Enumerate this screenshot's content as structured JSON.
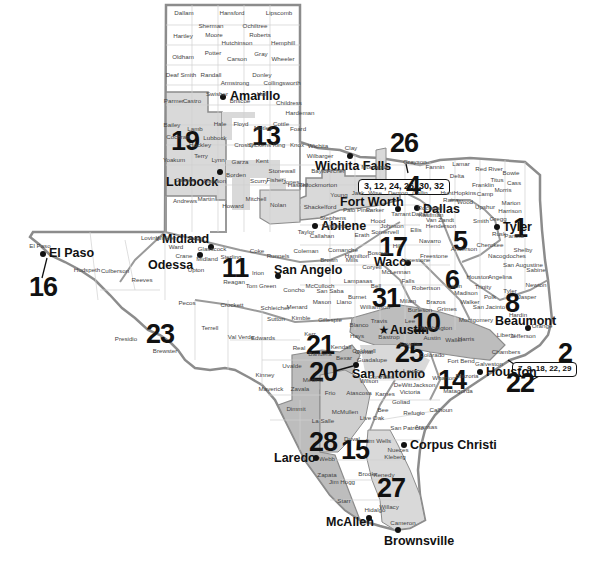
{
  "map": {
    "title": "Texas Regions Map",
    "colors": {
      "shaded_region": "#d9d9d9",
      "dark_shaded_region": "#bdbdbd",
      "border": "#8c8c8c",
      "county_line": "#cfcfcf",
      "text": "#111111"
    },
    "callouts": [
      {
        "id": "north",
        "text": "3, 12, 24, 26, 30, 32"
      },
      {
        "id": "gulf",
        "text": "7, 9, 18, 22, 29"
      }
    ],
    "regions": [
      {
        "number": "1"
      },
      {
        "number": "2"
      },
      {
        "number": "4"
      },
      {
        "number": "5"
      },
      {
        "number": "6"
      },
      {
        "number": "8"
      },
      {
        "number": "10"
      },
      {
        "number": "11"
      },
      {
        "number": "13"
      },
      {
        "number": "14"
      },
      {
        "number": "15"
      },
      {
        "number": "16"
      },
      {
        "number": "17"
      },
      {
        "number": "19"
      },
      {
        "number": "20"
      },
      {
        "number": "21"
      },
      {
        "number": "22"
      },
      {
        "number": "23"
      },
      {
        "number": "25"
      },
      {
        "number": "26"
      },
      {
        "number": "27"
      },
      {
        "number": "28"
      },
      {
        "number": "31"
      }
    ],
    "cities": [
      {
        "name": "Amarillo"
      },
      {
        "name": "Lubbock"
      },
      {
        "name": "Wichita Falls"
      },
      {
        "name": "Fort Worth"
      },
      {
        "name": "Dallas"
      },
      {
        "name": "Tyler"
      },
      {
        "name": "Abilene"
      },
      {
        "name": "Midland"
      },
      {
        "name": "Odessa"
      },
      {
        "name": "El Paso"
      },
      {
        "name": "San Angelo"
      },
      {
        "name": "Waco"
      },
      {
        "name": "Austin"
      },
      {
        "name": "Houston"
      },
      {
        "name": "Beaumont"
      },
      {
        "name": "San Antonio"
      },
      {
        "name": "Laredo"
      },
      {
        "name": "Corpus Christi"
      },
      {
        "name": "McAllen"
      },
      {
        "name": "Brownsville"
      }
    ],
    "counties": [
      "Dallam",
      "Hansford",
      "Lipscomb",
      "Sherman",
      "Ochiltree",
      "Hartley",
      "Moore",
      "Roberts",
      "Hemphill",
      "Hutchinson",
      "Oldham",
      "Potter",
      "Carson",
      "Gray",
      "Wheeler",
      "Deaf Smith",
      "Randall",
      "Donley",
      "Armstrong",
      "Collingsworth",
      "Parmer",
      "Castro",
      "Swisher",
      "Briscoe",
      "Hall",
      "Childress",
      "Hardeman",
      "Bailey",
      "Lamb",
      "Hale",
      "Floyd",
      "Motley",
      "Cottle",
      "Foard",
      "Cochran",
      "Hockley",
      "Lubbock",
      "Crosby",
      "Dickens",
      "King",
      "Knox",
      "Wilbarger",
      "Wichita",
      "Clay",
      "Baylor",
      "Archer",
      "Montague",
      "Yoakum",
      "Terry",
      "Lynn",
      "Garza",
      "Kent",
      "Stonewall",
      "Haskell",
      "Throckmorton",
      "Young",
      "Jack",
      "Wise",
      "Denton",
      "Collin",
      "Gaines",
      "Dawson",
      "Borden",
      "Scurry",
      "Fisher",
      "Jones",
      "Shackelford",
      "Stephens",
      "Palo Pinto",
      "Parker",
      "Tarrant",
      "Dallas",
      "Andrews",
      "Martin",
      "Howard",
      "Mitchell",
      "Nolan",
      "Taylor",
      "Callahan",
      "Eastland",
      "Erath",
      "Hood",
      "Johnson",
      "Somervell",
      "Ellis",
      "Loving",
      "Winkler",
      "Ector",
      "Midland",
      "Glasscock",
      "Sterling",
      "Coke",
      "Runnels",
      "Coleman",
      "Brown",
      "Comanche",
      "Hamilton",
      "Bosque",
      "Hill",
      "Ward",
      "Crane",
      "Upton",
      "Reagan",
      "Irion",
      "Tom Green",
      "Concho",
      "McCulloch",
      "Mills",
      "Coryell",
      "McLennan",
      "Limestone",
      "Freestone",
      "Navarro",
      "El Paso",
      "Hudspeth",
      "Culberson",
      "Reeves",
      "Pecos",
      "Terrell",
      "Crockett",
      "Schleicher",
      "Menard",
      "Mason",
      "Llano",
      "San Saba",
      "Lampasas",
      "Burnet",
      "Presidio",
      "Brewster",
      "Val Verde",
      "Sutton",
      "Kimble",
      "Gillespie",
      "Blanco",
      "Travis",
      "Williamson",
      "Bell",
      "Falls",
      "Milam",
      "Robertson",
      "Leon",
      "Madison",
      "Edwards",
      "Kerr",
      "Real",
      "Kendall",
      "Bandera",
      "Comal",
      "Hays",
      "Caldwell",
      "Bastrop",
      "Lee",
      "Burleson",
      "Brazos",
      "Grimes",
      "Walker",
      "Houston",
      "Trinity",
      "Kinney",
      "Uvalde",
      "Medina",
      "Bexar",
      "Guadalupe",
      "Gonzales",
      "Fayette",
      "Colorado",
      "Austin",
      "Waller",
      "Harris",
      "Washington",
      "Montgomery",
      "San Jacinto",
      "Polk",
      "Tyler",
      "Jasper",
      "Newton",
      "Maverick",
      "Zavala",
      "Frio",
      "Atascosa",
      "Wilson",
      "Karnes",
      "DeWitt",
      "Lavaca",
      "Jackson",
      "Wharton",
      "Fort Bend",
      "Brazoria",
      "Galveston",
      "Chambers",
      "Liberty",
      "Jefferson",
      "Orange",
      "Hardin",
      "Dimmit",
      "La Salle",
      "McMullen",
      "Live Oak",
      "Bee",
      "Goliad",
      "Victoria",
      "Calhoun",
      "Refugio",
      "Aransas",
      "San Patricio",
      "Matagorda",
      "Webb",
      "Duval",
      "Jim Wells",
      "Nueces",
      "Kleberg",
      "Zapata",
      "Jim Hogg",
      "Brooks",
      "Kenedy",
      "Starr",
      "Hidalgo",
      "Willacy",
      "Cameron",
      "Grayson",
      "Fannin",
      "Lamar",
      "Red River",
      "Bowie",
      "Delta",
      "Hopkins",
      "Franklin",
      "Titus",
      "Cass",
      "Morris",
      "Hunt",
      "Rains",
      "Wood",
      "Camp",
      "Upshur",
      "Marion",
      "Harrison",
      "Kaufman",
      "Rockwall",
      "Van Zandt",
      "Henderson",
      "Smith",
      "Gregg",
      "Rusk",
      "Panola",
      "Anderson",
      "Cherokee",
      "Nacogdoches",
      "Shelby",
      "San Augustine",
      "Sabine",
      "Angelina"
    ]
  }
}
